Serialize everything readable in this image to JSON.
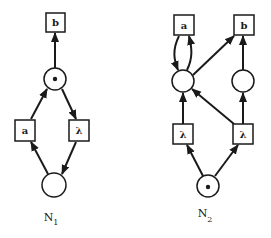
{
  "nets": [
    {
      "name": "N",
      "subscript": "1",
      "transitions": [
        {
          "id": "b",
          "label": "b"
        },
        {
          "id": "a",
          "label": "a"
        },
        {
          "id": "lambda",
          "label": "λ"
        }
      ],
      "places": [
        {
          "id": "p_top",
          "tokens": 1
        },
        {
          "id": "p_bottom",
          "tokens": 0
        }
      ]
    },
    {
      "name": "N",
      "subscript": "2",
      "transitions": [
        {
          "id": "a",
          "label": "a"
        },
        {
          "id": "b",
          "label": "b"
        },
        {
          "id": "lambda_left",
          "label": "λ"
        },
        {
          "id": "lambda_right",
          "label": "λ"
        }
      ],
      "places": [
        {
          "id": "p_left",
          "tokens": 0
        },
        {
          "id": "p_right",
          "tokens": 0
        },
        {
          "id": "p_bottom",
          "tokens": 1
        }
      ]
    }
  ]
}
